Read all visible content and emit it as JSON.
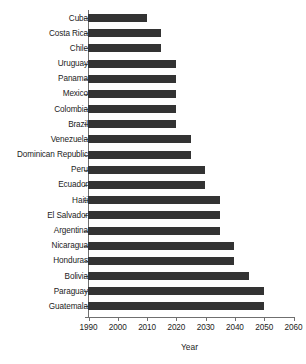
{
  "chart_data": {
    "type": "bar",
    "orientation": "horizontal",
    "title": "",
    "xlabel": "Year",
    "ylabel": "",
    "xlim": [
      1990,
      2060
    ],
    "xticks": [
      1990,
      2000,
      2010,
      2020,
      2030,
      2040,
      2050,
      2060
    ],
    "xtick_labels": [
      "1990",
      "2000",
      "2010",
      "2020",
      "2030",
      "2040",
      "2050",
      "2060"
    ],
    "grid": false,
    "legend": null,
    "baseline": 1990,
    "bar_color": "#333333",
    "axis_color": "#6f6f6f",
    "text_color": "#1c1c1c",
    "categories": [
      "Cuba",
      "Costa Rica",
      "Chile",
      "Uruguay",
      "Panama",
      "Mexico",
      "Colombia",
      "Brazil",
      "Venezuela",
      "Dominican Republic",
      "Peru",
      "Ecuador",
      "Haiti",
      "El Salvador",
      "Argentina",
      "Nicaragua",
      "Honduras",
      "Bolivia",
      "Paraguay",
      "Guatemala"
    ],
    "values": [
      2010,
      2015,
      2015,
      2020,
      2020,
      2020,
      2020,
      2020,
      2025,
      2025,
      2030,
      2030,
      2035,
      2035,
      2035,
      2040,
      2040,
      2045,
      2050,
      2050
    ]
  }
}
